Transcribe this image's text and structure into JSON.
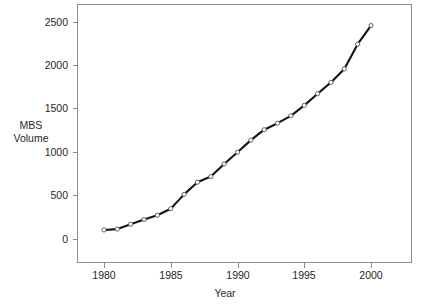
{
  "chart_data": {
    "type": "line",
    "title": "",
    "xlabel": "Year",
    "ylabel": "MBS Volume",
    "ylabel_lines": [
      "MBS",
      "Volume"
    ],
    "x": [
      1980,
      1981,
      1982,
      1983,
      1984,
      1985,
      1986,
      1987,
      1988,
      1989,
      1990,
      1991,
      1992,
      1993,
      1994,
      1995,
      1996,
      1997,
      1998,
      1999,
      2000
    ],
    "values": [
      110,
      120,
      175,
      230,
      280,
      355,
      520,
      660,
      725,
      870,
      1005,
      1145,
      1265,
      1340,
      1425,
      1545,
      1680,
      1810,
      1965,
      2250,
      2465
    ],
    "series": [
      {
        "name": "MBS Volume",
        "values": [
          110,
          120,
          175,
          230,
          280,
          355,
          520,
          660,
          725,
          870,
          1005,
          1145,
          1265,
          1340,
          1425,
          1545,
          1680,
          1810,
          1965,
          2250,
          2465
        ]
      }
    ],
    "xlim": [
      1978.1,
      1982.9
    ],
    "ylim": [
      -250,
      2700
    ],
    "xticks": [
      1980,
      1985,
      1990,
      1995,
      2000
    ],
    "xtick_labels": [
      "1980",
      "1985",
      "1990",
      "1995",
      "2000"
    ],
    "yticks": [
      0,
      500,
      1000,
      1500,
      2000,
      2500
    ],
    "ytick_labels": [
      "0",
      "500",
      "1000",
      "1500",
      "2000",
      "2500"
    ],
    "grid": false,
    "legend": false,
    "legend_position": "none",
    "line_color": "#141414",
    "marker_color": "#ffffff",
    "marker_edge_color": "#555555",
    "frame_color": "#8c8c8c",
    "background_color": "#ffffff"
  },
  "axes": {
    "x_axis_name": "year-axis",
    "y_axis_name": "mbs-volume-axis"
  }
}
